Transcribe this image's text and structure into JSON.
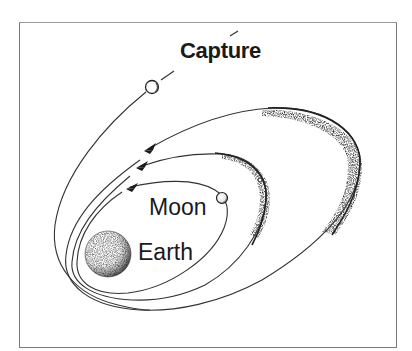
{
  "diagram": {
    "type": "orbital-capture-illustration",
    "labels": {
      "capture": "Capture",
      "moon": "Moon",
      "earth": "Earth"
    },
    "bodies": [
      {
        "name": "Earth",
        "role": "central body",
        "shading": "stippled"
      },
      {
        "name": "Moon",
        "role": "captured satellite on inner orbit"
      },
      {
        "name": "incoming body",
        "role": "object approaching on capture trajectory"
      },
      {
        "name": "small body",
        "role": "object on middle orbit"
      }
    ],
    "orbits": [
      {
        "name": "inner",
        "direction": "counter-clockwise",
        "arrow": true
      },
      {
        "name": "middle",
        "direction": "counter-clockwise",
        "arrow": true,
        "stippled_apoapsis": true
      },
      {
        "name": "outer",
        "direction": "counter-clockwise",
        "arrow": true,
        "stippled_apoapsis": true
      }
    ],
    "trajectory": {
      "name": "capture path",
      "style": "solid then dashed"
    },
    "colors": {
      "line": "#333333",
      "stipple": "#444444",
      "background": "#ffffff",
      "frame": "#7a7a7a"
    }
  }
}
